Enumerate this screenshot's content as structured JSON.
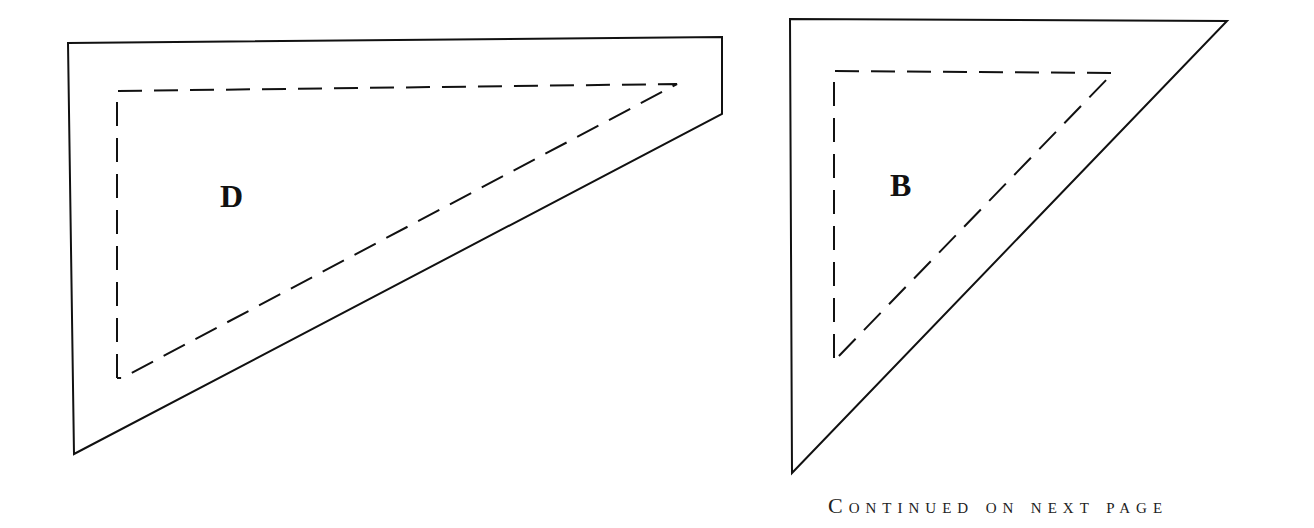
{
  "pieces": [
    {
      "label": "D",
      "outer_outline": [
        [
          68,
          43
        ],
        [
          722,
          37
        ],
        [
          722,
          114
        ],
        [
          74,
          454
        ]
      ],
      "inner_seam_line": [
        [
          117,
          91
        ],
        [
          677,
          84
        ],
        [
          122,
          378
        ]
      ],
      "label_position": [
        222,
        178
      ]
    },
    {
      "label": "B",
      "outer_outline": [
        [
          790,
          19
        ],
        [
          1227,
          21
        ],
        [
          792,
          473
        ]
      ],
      "inner_seam_line": [
        [
          834,
          71
        ],
        [
          1113,
          73
        ],
        [
          837,
          358
        ]
      ],
      "label_position": [
        892,
        167
      ]
    }
  ],
  "footer": {
    "text": "Continued on next page"
  },
  "colors": {
    "line": "#111111",
    "background": "#ffffff"
  }
}
